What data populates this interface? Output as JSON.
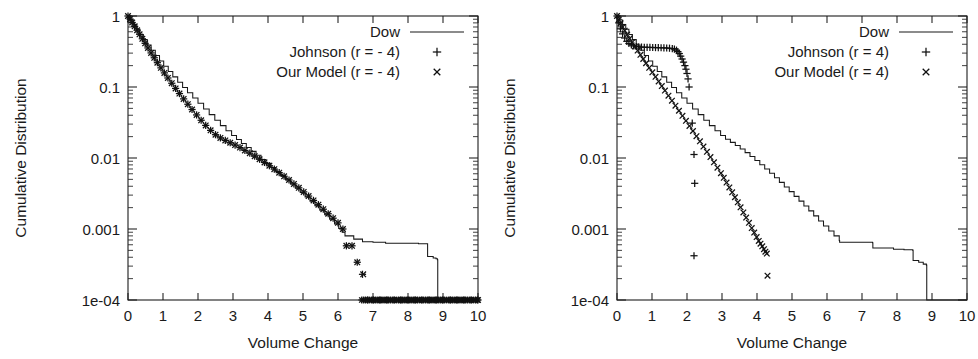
{
  "figure": {
    "background_color": "#ffffff",
    "ink_color": "#1a1a1a",
    "panel_count": 2
  },
  "chart_data": [
    {
      "id": "left",
      "type": "line",
      "title": "",
      "xlabel": "Volume Change",
      "ylabel": "Cumulative Distribution",
      "xlim": [
        0,
        10
      ],
      "ylim": [
        0.0001,
        1
      ],
      "yscale": "log",
      "xscale": "linear",
      "grid": false,
      "legend_position": "top-right",
      "xticks": [
        "0",
        "1",
        "2",
        "3",
        "4",
        "5",
        "6",
        "7",
        "8",
        "9",
        "10"
      ],
      "xtick_values": [
        0,
        1,
        2,
        3,
        4,
        5,
        6,
        7,
        8,
        9,
        10
      ],
      "yticks": [
        "1",
        "0.1",
        "0.01",
        "0.001",
        "1e-04"
      ],
      "ytick_values": [
        1,
        0.1,
        0.01,
        0.001,
        0.0001
      ],
      "legend": [
        {
          "label": "Dow",
          "marker": "line"
        },
        {
          "label": "Johnson (r = - 4)",
          "marker": "plus"
        },
        {
          "label": "Our Model (r = - 4)",
          "marker": "cross"
        }
      ],
      "series": [
        {
          "name": "Dow",
          "marker": "line",
          "x": [
            0.0,
            0.08,
            0.16,
            0.25,
            0.34,
            0.44,
            0.55,
            0.66,
            0.78,
            0.9,
            1.02,
            1.15,
            1.28,
            1.42,
            1.56,
            1.7,
            1.85,
            2.0,
            2.16,
            2.32,
            2.48,
            2.64,
            2.8,
            2.96,
            3.1,
            3.24,
            3.38,
            3.52,
            3.66,
            3.8,
            3.94,
            4.08,
            4.22,
            4.36,
            4.5,
            4.64,
            4.78,
            4.92,
            5.06,
            5.2,
            5.34,
            5.48,
            5.62,
            5.76,
            5.9,
            6.02,
            6.12,
            6.2,
            6.45,
            6.7,
            7.0,
            7.35,
            7.36,
            7.9,
            8.3,
            8.55,
            8.56,
            8.72,
            8.8,
            8.84,
            8.85,
            9.3,
            10.0
          ],
          "y": [
            1.0,
            0.88,
            0.76,
            0.65,
            0.55,
            0.465,
            0.39,
            0.33,
            0.277,
            0.233,
            0.196,
            0.165,
            0.139,
            0.117,
            0.0985,
            0.083,
            0.07,
            0.059,
            0.049,
            0.0408,
            0.034,
            0.0286,
            0.0242,
            0.0208,
            0.0182,
            0.016,
            0.0141,
            0.0124,
            0.0109,
            0.00955,
            0.0084,
            0.00735,
            0.00645,
            0.00565,
            0.00494,
            0.0043,
            0.00375,
            0.00326,
            0.00283,
            0.00246,
            0.00213,
            0.00184,
            0.00159,
            0.00137,
            0.00118,
            0.00102,
            0.0009,
            0.0008,
            0.00072,
            0.00066,
            0.00065,
            0.00065,
            0.00063,
            0.00063,
            0.00062,
            0.00062,
            0.00041,
            0.00039,
            0.00038,
            0.00037,
            0.0001,
            0.0001,
            0.0001
          ]
        },
        {
          "name": "Johnson (r = - 4)",
          "marker": "plus",
          "note": "overlaps Our Model almost exactly across the whole range",
          "x": [
            0.0,
            0.06,
            0.12,
            0.19,
            0.26,
            0.33,
            0.41,
            0.49,
            0.57,
            0.66,
            0.75,
            0.84,
            0.94,
            1.04,
            1.14,
            1.25,
            1.36,
            1.47,
            1.59,
            1.71,
            1.83,
            1.96,
            2.09,
            2.22,
            2.36,
            2.5,
            2.64,
            2.78,
            2.92,
            3.06,
            3.2,
            3.34,
            3.48,
            3.62,
            3.76,
            3.9,
            4.04,
            4.18,
            4.32,
            4.46,
            4.6,
            4.74,
            4.88,
            5.02,
            5.16,
            5.3,
            5.44,
            5.58,
            5.72,
            5.86,
            6.0,
            6.14,
            6.24,
            6.4,
            6.55,
            6.7,
            6.85,
            7.0,
            7.2,
            7.4,
            7.6,
            7.8,
            8.0,
            8.2,
            8.4,
            8.6,
            8.8,
            9.0,
            9.2,
            9.4,
            9.6,
            9.8,
            10.0
          ],
          "y": [
            1.0,
            0.905,
            0.81,
            0.715,
            0.63,
            0.553,
            0.478,
            0.412,
            0.355,
            0.302,
            0.258,
            0.22,
            0.186,
            0.158,
            0.134,
            0.113,
            0.0955,
            0.0808,
            0.068,
            0.0572,
            0.0482,
            0.0404,
            0.034,
            0.0288,
            0.0245,
            0.0213,
            0.0192,
            0.0177,
            0.0164,
            0.0152,
            0.014,
            0.0128,
            0.0117,
            0.0106,
            0.0096,
            0.00866,
            0.00778,
            0.00697,
            0.00622,
            0.00553,
            0.0049,
            0.00432,
            0.0038,
            0.00333,
            0.00291,
            0.00253,
            0.0022,
            0.0019,
            0.00164,
            0.00142,
            0.00122,
            0.001,
            0.00058,
            0.00058,
            0.00034,
            0.00023,
            0.0001,
            0.0001,
            0.0001,
            0.0001,
            0.0001,
            0.0001,
            0.0001,
            0.0001,
            0.0001,
            0.0001,
            0.0001,
            0.0001,
            0.0001,
            0.0001,
            0.0001,
            0.0001,
            0.0001
          ]
        },
        {
          "name": "Our Model (r = - 4)",
          "marker": "cross",
          "x": [
            0.0,
            0.06,
            0.12,
            0.19,
            0.26,
            0.33,
            0.41,
            0.49,
            0.57,
            0.66,
            0.75,
            0.84,
            0.94,
            1.04,
            1.14,
            1.25,
            1.36,
            1.47,
            1.59,
            1.71,
            1.83,
            1.96,
            2.09,
            2.22,
            2.36,
            2.5,
            2.64,
            2.78,
            2.92,
            3.06,
            3.2,
            3.34,
            3.48,
            3.62,
            3.76,
            3.9,
            4.04,
            4.18,
            4.32,
            4.46,
            4.6,
            4.74,
            4.88,
            5.02,
            5.16,
            5.3,
            5.44,
            5.58,
            5.72,
            5.86,
            6.0,
            6.14,
            6.24,
            6.4,
            6.55,
            6.72,
            6.9,
            7.1,
            7.3,
            7.5,
            7.7,
            7.9,
            8.1,
            8.3,
            8.5,
            8.7,
            8.9,
            9.1,
            9.3,
            9.5,
            9.7,
            9.9,
            10.0
          ],
          "y": [
            1.0,
            0.905,
            0.81,
            0.715,
            0.63,
            0.553,
            0.478,
            0.412,
            0.355,
            0.302,
            0.258,
            0.22,
            0.186,
            0.158,
            0.134,
            0.113,
            0.0955,
            0.0808,
            0.068,
            0.0572,
            0.0482,
            0.0404,
            0.034,
            0.0288,
            0.0245,
            0.0213,
            0.0192,
            0.0177,
            0.0164,
            0.0152,
            0.014,
            0.0128,
            0.0117,
            0.0106,
            0.0096,
            0.00866,
            0.00778,
            0.00697,
            0.00622,
            0.00553,
            0.0049,
            0.00432,
            0.0038,
            0.00333,
            0.00291,
            0.00253,
            0.0022,
            0.0019,
            0.00164,
            0.00142,
            0.00122,
            0.001,
            0.00058,
            0.00058,
            0.00034,
            0.00023,
            0.0001,
            0.0001,
            0.0001,
            0.0001,
            0.0001,
            0.0001,
            0.0001,
            0.0001,
            0.0001,
            0.0001,
            0.0001,
            0.0001,
            0.0001,
            0.0001,
            0.0001,
            0.0001,
            0.0001
          ]
        }
      ]
    },
    {
      "id": "right",
      "type": "line",
      "title": "",
      "xlabel": "Volume Change",
      "ylabel": "Cumulative Distribution",
      "xlim": [
        0,
        10
      ],
      "ylim": [
        0.0001,
        1
      ],
      "yscale": "log",
      "xscale": "linear",
      "grid": false,
      "legend_position": "top-right",
      "xticks": [
        "0",
        "1",
        "2",
        "3",
        "4",
        "5",
        "6",
        "7",
        "8",
        "9",
        "10"
      ],
      "xtick_values": [
        0,
        1,
        2,
        3,
        4,
        5,
        6,
        7,
        8,
        9,
        10
      ],
      "yticks": [
        "1",
        "0.1",
        "0.01",
        "0.001",
        "1e-04"
      ],
      "ytick_values": [
        1,
        0.1,
        0.01,
        0.001,
        0.0001
      ],
      "legend": [
        {
          "label": "Dow",
          "marker": "line"
        },
        {
          "label": "Johnson (r = 4)",
          "marker": "plus"
        },
        {
          "label": "Our Model (r = 4)",
          "marker": "cross"
        }
      ],
      "series": [
        {
          "name": "Dow",
          "marker": "line",
          "x": [
            0.0,
            0.08,
            0.16,
            0.25,
            0.34,
            0.44,
            0.55,
            0.66,
            0.78,
            0.9,
            1.02,
            1.15,
            1.28,
            1.42,
            1.56,
            1.7,
            1.85,
            2.0,
            2.16,
            2.32,
            2.48,
            2.64,
            2.8,
            2.96,
            3.1,
            3.24,
            3.38,
            3.52,
            3.66,
            3.8,
            3.94,
            4.08,
            4.22,
            4.36,
            4.5,
            4.64,
            4.78,
            4.92,
            5.06,
            5.2,
            5.34,
            5.48,
            5.62,
            5.76,
            5.9,
            6.05,
            6.2,
            6.35,
            6.36,
            6.9,
            7.3,
            7.31,
            7.9,
            8.2,
            8.45,
            8.46,
            8.62,
            8.75,
            8.84,
            8.85,
            9.3,
            10.0
          ],
          "y": [
            1.0,
            0.88,
            0.76,
            0.65,
            0.55,
            0.465,
            0.39,
            0.33,
            0.277,
            0.233,
            0.196,
            0.165,
            0.139,
            0.117,
            0.0985,
            0.083,
            0.07,
            0.059,
            0.049,
            0.0408,
            0.034,
            0.0286,
            0.0242,
            0.0208,
            0.0184,
            0.0166,
            0.015,
            0.0134,
            0.0119,
            0.0105,
            0.0092,
            0.00805,
            0.007,
            0.00608,
            0.00526,
            0.00454,
            0.00391,
            0.00336,
            0.00288,
            0.00247,
            0.00211,
            0.0018,
            0.00153,
            0.0013,
            0.0011,
            0.00094,
            0.0008,
            0.00069,
            0.00065,
            0.00065,
            0.00064,
            0.00054,
            0.00052,
            0.00051,
            0.0005,
            0.00036,
            0.00034,
            0.00032,
            0.00031,
            0.0001,
            0.0001,
            0.0001
          ]
        },
        {
          "name": "Johnson (r = 4)",
          "marker": "plus",
          "note": "shoulder/plateau near y=0.35 between x=0.7 and x=1.8, then sparse isolated outliers near x=2.0-2.2",
          "x": [
            0.0,
            0.05,
            0.1,
            0.16,
            0.22,
            0.28,
            0.34,
            0.41,
            0.48,
            0.55,
            0.62,
            0.7,
            0.78,
            0.86,
            0.94,
            1.02,
            1.1,
            1.18,
            1.26,
            1.34,
            1.42,
            1.5,
            1.58,
            1.64,
            1.7,
            1.74,
            1.78,
            1.82,
            1.86,
            1.9,
            1.94,
            1.97,
            2.0,
            2.03,
            2.06,
            2.15,
            2.2,
            2.22,
            2.2
          ],
          "y": [
            1.0,
            0.8,
            0.66,
            0.56,
            0.49,
            0.44,
            0.41,
            0.392,
            0.38,
            0.372,
            0.368,
            0.365,
            0.363,
            0.362,
            0.361,
            0.36,
            0.359,
            0.358,
            0.357,
            0.356,
            0.354,
            0.352,
            0.348,
            0.342,
            0.33,
            0.315,
            0.296,
            0.272,
            0.248,
            0.224,
            0.2,
            0.178,
            0.155,
            0.13,
            0.1,
            0.031,
            0.0112,
            0.0044,
            0.00042
          ]
        },
        {
          "name": "Our Model (r = 4)",
          "marker": "cross",
          "x": [
            0.0,
            0.05,
            0.1,
            0.16,
            0.22,
            0.29,
            0.36,
            0.43,
            0.51,
            0.59,
            0.67,
            0.75,
            0.83,
            0.92,
            1.01,
            1.1,
            1.19,
            1.28,
            1.37,
            1.47,
            1.57,
            1.67,
            1.77,
            1.87,
            1.97,
            2.07,
            2.17,
            2.27,
            2.37,
            2.47,
            2.57,
            2.67,
            2.77,
            2.87,
            2.97,
            3.05,
            3.13,
            3.21,
            3.29,
            3.37,
            3.45,
            3.53,
            3.61,
            3.69,
            3.77,
            3.85,
            3.92,
            3.99,
            4.05,
            4.1,
            4.15,
            4.2,
            4.24,
            4.28,
            4.3
          ],
          "y": [
            1.0,
            0.89,
            0.79,
            0.7,
            0.62,
            0.548,
            0.482,
            0.424,
            0.372,
            0.326,
            0.284,
            0.248,
            0.216,
            0.186,
            0.161,
            0.139,
            0.12,
            0.103,
            0.089,
            0.0755,
            0.0641,
            0.0545,
            0.0463,
            0.0393,
            0.0334,
            0.0283,
            0.024,
            0.0203,
            0.0172,
            0.0145,
            0.0122,
            0.0103,
            0.0087,
            0.0073,
            0.00612,
            0.00525,
            0.0045,
            0.00385,
            0.00328,
            0.0028,
            0.00238,
            0.00202,
            0.00171,
            0.00145,
            0.00122,
            0.00103,
            0.00089,
            0.00077,
            0.00068,
            0.00062,
            0.00057,
            0.00052,
            0.00048,
            0.00045,
            0.00022
          ]
        }
      ]
    }
  ]
}
